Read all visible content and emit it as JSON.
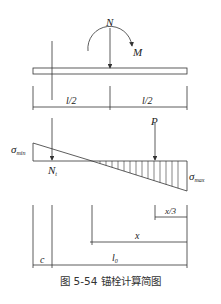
{
  "figure": {
    "caption": "图 5-54    锚栓计算简图",
    "labels": {
      "N": "N",
      "M": "M",
      "half_left": "l/2",
      "half_right": "l/2",
      "P": "P",
      "sigma_min": "σ",
      "sigma_min_sub": "min",
      "sigma_max": "σ",
      "sigma_max_sub": "max",
      "Nt": "N",
      "Nt_sub": "t",
      "x_third": "x/3",
      "x": "x",
      "l0": "l",
      "l0_sub": "0",
      "c": "c"
    },
    "colors": {
      "line": "#333333",
      "background": "#ffffff"
    }
  }
}
